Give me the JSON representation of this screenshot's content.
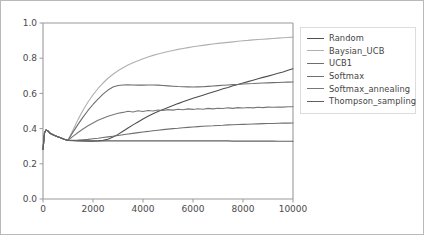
{
  "figure": {
    "border_color": "#b9b9b9",
    "background": "#ffffff"
  },
  "axes": {
    "spine_color": "#9a9a9a",
    "plot_left": 42,
    "plot_right": 292,
    "plot_top": 22,
    "plot_bottom": 198
  },
  "legend": {
    "position": "right-outside",
    "border_color": "#dcdcdc",
    "entries": [
      {
        "label": "Random",
        "color": "#4f4f4f"
      },
      {
        "label": "Baysian_UCB",
        "color": "#b0b0b0"
      },
      {
        "label": "UCB1",
        "color": "#6e6e6e"
      },
      {
        "label": "Softmax",
        "color": "#707070"
      },
      {
        "label": "Softmax_annealing",
        "color": "#787878"
      },
      {
        "label": "Thompson_sampling",
        "color": "#606060"
      }
    ]
  },
  "chart_data": {
    "type": "line",
    "title": "",
    "xlabel": "",
    "ylabel": "",
    "xlim": [
      0,
      10000
    ],
    "ylim": [
      0.0,
      1.0
    ],
    "grid": false,
    "legend_position": "right-outside",
    "xticks": [
      0,
      2000,
      4000,
      6000,
      8000,
      10000
    ],
    "xtick_labels": [
      "0",
      "2000",
      "4000",
      "6000",
      "8000",
      "10000"
    ],
    "yticks": [
      0.0,
      0.2,
      0.4,
      0.6,
      0.8,
      1.0
    ],
    "ytick_labels": [
      "0.0",
      "0.2",
      "0.4",
      "0.6",
      "0.8",
      "1.0"
    ],
    "x": [
      0,
      60,
      120,
      200,
      300,
      420,
      560,
      700,
      850,
      1000,
      1200,
      1400,
      1600,
      1800,
      2000,
      2200,
      2400,
      2600,
      2800,
      3000,
      3200,
      3400,
      3600,
      3800,
      4000,
      4200,
      4400,
      4600,
      4800,
      5000,
      5200,
      5400,
      5600,
      5800,
      6000,
      6200,
      6400,
      6600,
      6800,
      7000,
      7200,
      7400,
      7600,
      7800,
      8000,
      8200,
      8400,
      8600,
      8800,
      9000,
      9200,
      9400,
      9600,
      9800,
      10000
    ],
    "series": [
      {
        "name": "Random",
        "color": "#4f4f4f",
        "values": [
          0.282,
          0.375,
          0.392,
          0.386,
          0.372,
          0.363,
          0.355,
          0.348,
          0.34,
          0.333,
          0.332,
          0.331,
          0.33,
          0.329,
          0.329,
          0.33,
          0.333,
          0.34,
          0.352,
          0.367,
          0.385,
          0.403,
          0.421,
          0.438,
          0.455,
          0.47,
          0.484,
          0.497,
          0.509,
          0.52,
          0.531,
          0.542,
          0.552,
          0.562,
          0.572,
          0.581,
          0.59,
          0.599,
          0.608,
          0.617,
          0.626,
          0.634,
          0.643,
          0.651,
          0.659,
          0.667,
          0.675,
          0.683,
          0.691,
          0.698,
          0.706,
          0.714,
          0.722,
          0.731,
          0.74
        ]
      },
      {
        "name": "Baysian_UCB",
        "color": "#b0b0b0",
        "values": [
          0.282,
          0.375,
          0.392,
          0.386,
          0.372,
          0.363,
          0.355,
          0.348,
          0.34,
          0.334,
          0.392,
          0.451,
          0.504,
          0.551,
          0.592,
          0.628,
          0.659,
          0.686,
          0.709,
          0.729,
          0.746,
          0.761,
          0.774,
          0.786,
          0.797,
          0.807,
          0.816,
          0.824,
          0.831,
          0.838,
          0.844,
          0.85,
          0.855,
          0.86,
          0.865,
          0.869,
          0.873,
          0.877,
          0.881,
          0.884,
          0.887,
          0.89,
          0.893,
          0.896,
          0.899,
          0.901,
          0.904,
          0.906,
          0.908,
          0.91,
          0.912,
          0.914,
          0.916,
          0.918,
          0.92
        ]
      },
      {
        "name": "UCB1",
        "color": "#6e6e6e",
        "values": [
          0.282,
          0.375,
          0.392,
          0.386,
          0.372,
          0.363,
          0.355,
          0.348,
          0.34,
          0.334,
          0.38,
          0.424,
          0.465,
          0.503,
          0.537,
          0.568,
          0.596,
          0.619,
          0.636,
          0.645,
          0.648,
          0.649,
          0.648,
          0.647,
          0.647,
          0.648,
          0.648,
          0.647,
          0.645,
          0.643,
          0.641,
          0.639,
          0.638,
          0.637,
          0.636,
          0.637,
          0.638,
          0.64,
          0.642,
          0.644,
          0.646,
          0.648,
          0.65,
          0.651,
          0.653,
          0.655,
          0.656,
          0.658,
          0.659,
          0.66,
          0.661,
          0.662,
          0.663,
          0.664,
          0.665
        ]
      },
      {
        "name": "Softmax",
        "color": "#707070",
        "values": [
          0.282,
          0.375,
          0.392,
          0.386,
          0.372,
          0.363,
          0.355,
          0.348,
          0.34,
          0.333,
          0.334,
          0.335,
          0.337,
          0.339,
          0.342,
          0.345,
          0.349,
          0.353,
          0.357,
          0.361,
          0.365,
          0.369,
          0.373,
          0.377,
          0.381,
          0.384,
          0.388,
          0.391,
          0.394,
          0.397,
          0.4,
          0.402,
          0.405,
          0.407,
          0.409,
          0.411,
          0.413,
          0.415,
          0.416,
          0.418,
          0.419,
          0.421,
          0.422,
          0.423,
          0.424,
          0.425,
          0.426,
          0.427,
          0.428,
          0.429,
          0.429,
          0.43,
          0.431,
          0.431,
          0.432
        ]
      },
      {
        "name": "Softmax_annealing",
        "color": "#787878",
        "values": [
          0.282,
          0.375,
          0.392,
          0.386,
          0.372,
          0.363,
          0.355,
          0.348,
          0.34,
          0.334,
          0.356,
          0.378,
          0.398,
          0.416,
          0.432,
          0.447,
          0.459,
          0.47,
          0.479,
          0.487,
          0.492,
          0.499,
          0.494,
          0.501,
          0.497,
          0.503,
          0.5,
          0.506,
          0.503,
          0.508,
          0.505,
          0.51,
          0.507,
          0.512,
          0.509,
          0.513,
          0.51,
          0.515,
          0.512,
          0.516,
          0.514,
          0.518,
          0.515,
          0.519,
          0.517,
          0.52,
          0.518,
          0.521,
          0.519,
          0.522,
          0.521,
          0.523,
          0.522,
          0.524,
          0.524
        ]
      },
      {
        "name": "Thompson_sampling",
        "color": "#606060",
        "values": [
          0.282,
          0.375,
          0.392,
          0.386,
          0.372,
          0.363,
          0.355,
          0.348,
          0.34,
          0.332,
          0.331,
          0.33,
          0.33,
          0.33,
          0.33,
          0.33,
          0.33,
          0.33,
          0.33,
          0.33,
          0.33,
          0.33,
          0.33,
          0.33,
          0.33,
          0.33,
          0.33,
          0.33,
          0.33,
          0.33,
          0.33,
          0.33,
          0.33,
          0.33,
          0.33,
          0.33,
          0.33,
          0.33,
          0.33,
          0.33,
          0.33,
          0.33,
          0.329,
          0.329,
          0.329,
          0.329,
          0.329,
          0.329,
          0.329,
          0.329,
          0.329,
          0.328,
          0.328,
          0.328,
          0.328
        ]
      }
    ]
  }
}
